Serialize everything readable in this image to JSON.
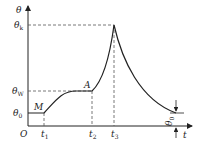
{
  "diagram": {
    "type": "temperature-time curve",
    "axes": {
      "y_label": "θ",
      "x_label": "t",
      "origin_label": "O"
    },
    "y_levels": [
      {
        "symbol": "θ",
        "subscript": "k",
        "name": "theta-k"
      },
      {
        "symbol": "θ",
        "subscript": "W",
        "name": "theta-w"
      },
      {
        "symbol": "θ",
        "subscript": "0",
        "name": "theta-0"
      }
    ],
    "x_marks": [
      {
        "symbol": "t",
        "subscript": "1"
      },
      {
        "symbol": "t",
        "subscript": "2"
      },
      {
        "symbol": "t",
        "subscript": "3"
      }
    ],
    "points": {
      "M": "M",
      "A": "A"
    },
    "end_annotation": {
      "symbol": "θ",
      "subscript": "0"
    },
    "colors": {
      "line": "#222222",
      "dash": "#555555"
    }
  }
}
